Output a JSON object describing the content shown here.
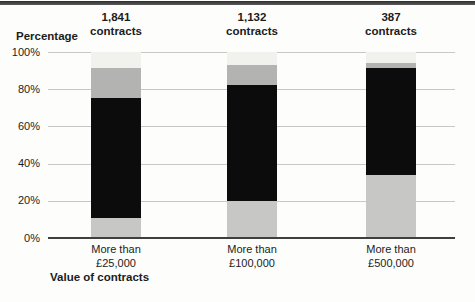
{
  "figure": {
    "y_axis_title": "Percentage",
    "x_axis_title": "Value of contracts"
  },
  "colors": {
    "top_rule": "#3a3a3a",
    "gridline": "#c8c8c6",
    "axis_line": "#3f3f3f",
    "text": "#1c1c1c",
    "background": "#fdfdfb"
  },
  "chart_data": {
    "type": "bar",
    "subtype": "stacked-percentage-column",
    "title": "",
    "xlabel": "Value of contracts",
    "ylabel": "Percentage",
    "ylim": [
      0,
      100
    ],
    "grid": true,
    "legend": "none",
    "ytick_values": [
      100,
      80,
      60,
      40,
      20,
      0
    ],
    "ytick_labels": [
      "100%",
      "80%",
      "60%",
      "40%",
      "20%",
      "0%"
    ],
    "categories": [
      "More than £25,000",
      "More than £100,000",
      "More than £500,000"
    ],
    "category_label_lines": [
      [
        "More than",
        "£25,000"
      ],
      [
        "More than",
        "£100,000"
      ],
      [
        "More than",
        "£500,000"
      ]
    ],
    "bar_header_lines": [
      [
        "1,841",
        "contracts"
      ],
      [
        "1,132",
        "contracts"
      ],
      [
        "387",
        "contracts"
      ]
    ],
    "series": [
      {
        "name": "bottom-light-grey",
        "color": "#c7c7c5",
        "values": [
          11,
          20,
          34
        ]
      },
      {
        "name": "black",
        "color": "#0c0c0c",
        "values": [
          64.5,
          62,
          57.5
        ]
      },
      {
        "name": "mid-grey",
        "color": "#b3b3b1",
        "values": [
          16,
          11,
          2.5
        ]
      },
      {
        "name": "pale-grey",
        "color": "#f1f1ee",
        "values": [
          8.5,
          7,
          6
        ]
      }
    ]
  }
}
